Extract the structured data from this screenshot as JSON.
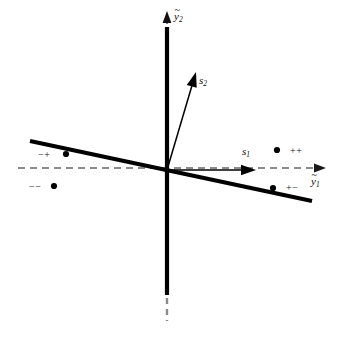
{
  "figure": {
    "type": "diagram",
    "background_color": "#ffffff",
    "ink_color": "#000000",
    "dashed_axis_color": "#8a8a8a"
  },
  "axes": {
    "horizontal": {
      "name": "y1-axis",
      "label_base": "y",
      "label_sub": "1",
      "tilde": "~",
      "style": "dashed",
      "color": "#8a8a8a",
      "arrow": "right",
      "x_start": 18,
      "x_end": 326,
      "y": 168
    },
    "vertical": {
      "name": "y2-axis",
      "label_base": "y",
      "label_sub": "2",
      "tilde": "~",
      "style": "solid-thick-with-dashed-extensions",
      "color": "#000000",
      "arrow": "up",
      "x": 167,
      "y_top": 14,
      "y_bottom": 320,
      "solid_top": 28,
      "solid_bottom": 295
    }
  },
  "vectors": [
    {
      "name": "s1-vector",
      "label_base": "s",
      "label_sub": "1",
      "from_x": 167,
      "from_y": 170,
      "to_x": 256,
      "to_y": 170,
      "color": "#000000"
    },
    {
      "name": "s2-vector",
      "label_base": "s",
      "label_sub": "2",
      "from_x": 167,
      "from_y": 170,
      "to_x": 196,
      "to_y": 72,
      "color": "#000000"
    }
  ],
  "lines": [
    {
      "name": "principal-axis-line",
      "x1": 30,
      "y1": 141,
      "x2": 312,
      "y2": 201,
      "width": 4,
      "color": "#000000"
    }
  ],
  "points": [
    {
      "name": "point-minus-plus",
      "sign_label": "−+",
      "cx": 66,
      "cy": 154,
      "label_x": 38,
      "label_y": 150,
      "quadrant": "upper-left"
    },
    {
      "name": "point-minus-minus",
      "sign_label": "−−",
      "cx": 54,
      "cy": 186,
      "label_x": 29,
      "label_y": 182,
      "quadrant": "lower-left"
    },
    {
      "name": "point-plus-plus",
      "sign_label": "++",
      "cx": 277,
      "cy": 150,
      "label_x": 290,
      "label_y": 146,
      "quadrant": "upper-right"
    },
    {
      "name": "point-plus-minus",
      "sign_label": "+−",
      "cx": 273,
      "cy": 188,
      "label_x": 286,
      "label_y": 183,
      "quadrant": "lower-right"
    }
  ],
  "label_positions": {
    "y1": {
      "x": 311,
      "y": 176
    },
    "y2": {
      "x": 174,
      "y": 11
    },
    "s1": {
      "x": 242,
      "y": 146
    },
    "s2": {
      "x": 199,
      "y": 75
    }
  }
}
